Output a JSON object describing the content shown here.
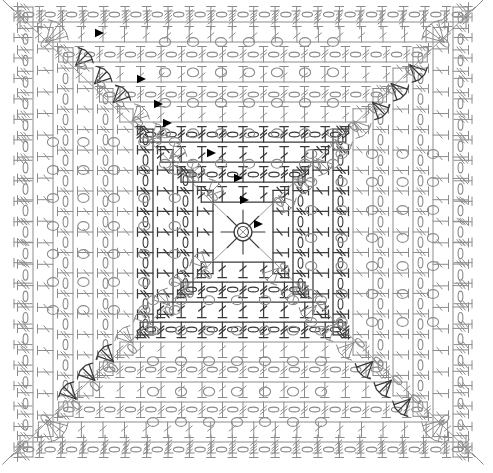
{
  "document": {
    "kind": "crochet-stitch-chart",
    "title": "Square Motif Crochet Chart",
    "shape": "square",
    "symmetry": "4-fold rotational (quarter-turn)",
    "background_color": "#ffffff",
    "stroke_color": "#8c8c8c",
    "accent_color": "#3a3a3a",
    "marker_color": "#000000",
    "canvas": {
      "width": 493,
      "height": 473
    }
  },
  "legend": {
    "symbols": [
      {
        "key": "chain",
        "name": "chain-stitch-oval",
        "glyph": "o",
        "description": "small oval / zero = chain stitch"
      },
      {
        "key": "double_crochet",
        "name": "double-crochet-bar",
        "glyph": "T",
        "description": "vertical stem with top cross-bar and one slash"
      },
      {
        "key": "treble",
        "name": "treble-crochet-bar",
        "glyph": "T",
        "description": "vertical stem with cross-bar and two slashes"
      },
      {
        "key": "cluster3",
        "name": "three-together-cluster",
        "glyph": "A",
        "description": "three stems joined at a point"
      },
      {
        "key": "fan",
        "name": "fan-shell-group",
        "glyph": "<",
        "description": "several stems radiating from one point"
      },
      {
        "key": "marker",
        "name": "direction-arrow-marker",
        "glyph": "◀",
        "description": "solid black triangle marking round start/direction"
      },
      {
        "key": "ring",
        "name": "center-ring",
        "glyph": "○",
        "description": "magic ring at center of motif"
      }
    ]
  },
  "chart_data": {
    "type": "diagram",
    "rounds": 16,
    "center": {
      "x": 243,
      "y": 232,
      "radius": 9,
      "label": "center-ring"
    },
    "quadrants": [
      "top",
      "right",
      "bottom",
      "left"
    ],
    "grid": {
      "columns": 22,
      "rows": 22,
      "cell_width": 21,
      "cell_height": 20,
      "origin_x": 22,
      "origin_y": 18
    },
    "edges": {
      "top": {
        "stitch": "treble",
        "count": 22,
        "orientation": "vertical-up"
      },
      "bottom": {
        "stitch": "treble",
        "count": 22,
        "orientation": "vertical-down"
      },
      "left": {
        "stitch": "treble",
        "count": 22,
        "orientation": "horizontal-left"
      },
      "right": {
        "stitch": "treble",
        "count": 22,
        "orientation": "horizontal-right"
      }
    },
    "markers": [
      {
        "x": 104,
        "y": 33
      },
      {
        "x": 146,
        "y": 79
      },
      {
        "x": 163,
        "y": 104
      },
      {
        "x": 172,
        "y": 123
      },
      {
        "x": 216,
        "y": 153
      },
      {
        "x": 243,
        "y": 178
      },
      {
        "x": 249,
        "y": 200
      },
      {
        "x": 263,
        "y": 224
      }
    ],
    "corner_fans": [
      {
        "corner": "top-left",
        "x": 46,
        "y": 42
      },
      {
        "corner": "top-right",
        "x": 444,
        "y": 42
      },
      {
        "corner": "bottom-left",
        "x": 46,
        "y": 420
      },
      {
        "corner": "bottom-right",
        "x": 444,
        "y": 420
      }
    ],
    "notes": [
      "Chain stitches are rendered as small ovals aligned with the working direction.",
      "Quadrant stitches point outward from the center ring.",
      "Diagonal seams run corner-to-corner through the center.",
      "Arrow markers trace the round progression from the upper-left toward the center."
    ]
  }
}
